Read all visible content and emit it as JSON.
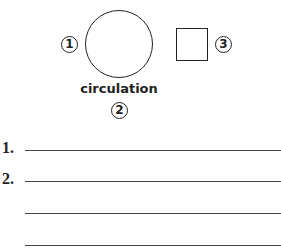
{
  "diagram": {
    "labels": {
      "one": "1",
      "two": "2",
      "three": "3"
    },
    "caption": "circulation"
  },
  "answers": {
    "items": [
      {
        "number": "1."
      },
      {
        "number": "2."
      }
    ]
  }
}
